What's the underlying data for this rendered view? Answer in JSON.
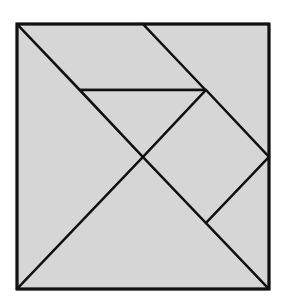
{
  "diagram": {
    "type": "tangram",
    "fill_color": "#d6d6d6",
    "stroke_color": "#111111",
    "background_color": "#ffffff",
    "outer_square": {
      "x": 17,
      "y": 24,
      "width": 252,
      "height": 265
    },
    "pieces": [
      {
        "name": "large-triangle-left",
        "points": "17,24 17,289 143,157"
      },
      {
        "name": "large-triangle-bottom",
        "points": "17,289 269,289 143,157"
      },
      {
        "name": "parallelogram-top",
        "points": "17,24 143,24 206,90 80,90"
      },
      {
        "name": "medium-triangle-top-right",
        "points": "143,24 269,24 269,157"
      },
      {
        "name": "small-triangle-center",
        "points": "80,90 206,90 143,157"
      },
      {
        "name": "square-right",
        "points": "143,157 206,90 269,157 206,223"
      },
      {
        "name": "small-triangle-bottom-right",
        "points": "269,157 269,289 206,223"
      }
    ]
  }
}
